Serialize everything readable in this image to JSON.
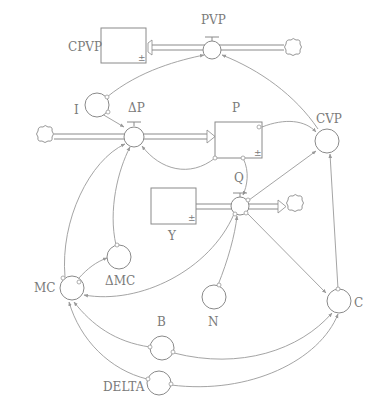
{
  "diagram": {
    "type": "system-dynamics stock-and-flow",
    "stocks": [
      {
        "id": "CPVP",
        "label": "CPVP"
      },
      {
        "id": "P",
        "label": "P"
      },
      {
        "id": "Y",
        "label": "Y"
      }
    ],
    "flows": [
      {
        "id": "PVP",
        "label": "PVP",
        "from": "cloud",
        "to": "CPVP"
      },
      {
        "id": "dP",
        "label": "ΔP",
        "from": "cloud",
        "to": "P"
      },
      {
        "id": "Q",
        "label": "Q",
        "from": "Y",
        "to": "cloud"
      }
    ],
    "auxiliaries": [
      {
        "id": "I",
        "label": "I"
      },
      {
        "id": "CVP",
        "label": "CVP"
      },
      {
        "id": "dMC",
        "label": "ΔMC"
      },
      {
        "id": "MC",
        "label": "MC"
      },
      {
        "id": "N",
        "label": "N"
      },
      {
        "id": "C",
        "label": "C"
      },
      {
        "id": "B",
        "label": "B"
      },
      {
        "id": "DELTA",
        "label": "DELTA"
      }
    ],
    "stock_marker": "±",
    "links": [
      [
        "I",
        "PVP"
      ],
      [
        "I",
        "ΔP"
      ],
      [
        "CVP",
        "PVP"
      ],
      [
        "P",
        "CVP"
      ],
      [
        "P",
        "ΔP"
      ],
      [
        "P",
        "Q"
      ],
      [
        "Q",
        "CVP"
      ],
      [
        "Q",
        "C"
      ],
      [
        "Q",
        "MC"
      ],
      [
        "N",
        "Q"
      ],
      [
        "MC",
        "ΔP"
      ],
      [
        "ΔMC",
        "ΔP"
      ],
      [
        "MC",
        "ΔMC"
      ],
      [
        "C",
        "CVP"
      ],
      [
        "B",
        "MC"
      ],
      [
        "B",
        "C"
      ],
      [
        "DELTA",
        "MC"
      ],
      [
        "DELTA",
        "C"
      ]
    ]
  },
  "colors": {
    "line": "#8a8a8a",
    "link": "#9a9a9a",
    "text": "#7a7a7a",
    "background": "#ffffff"
  }
}
